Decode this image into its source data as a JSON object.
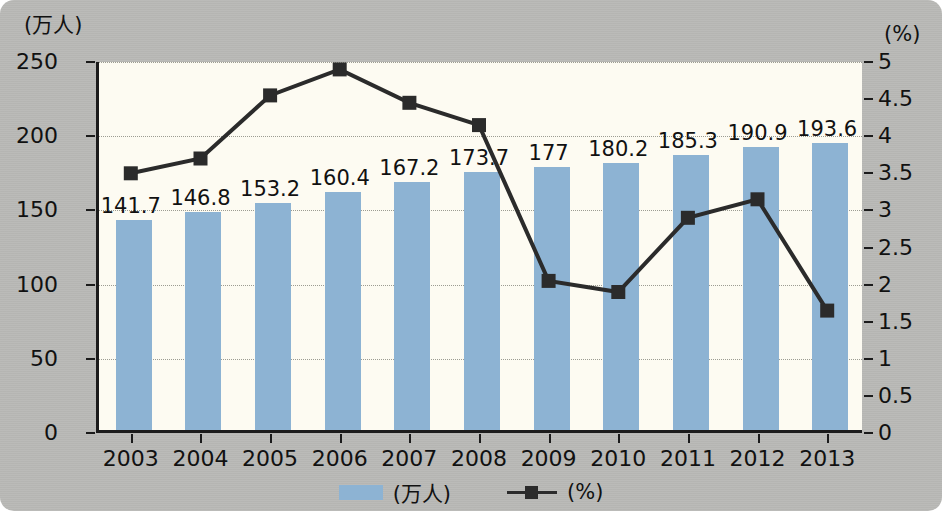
{
  "chart_data": {
    "type": "bar",
    "title": "",
    "subtitle": "",
    "categories": [
      "2003",
      "2004",
      "2005",
      "2006",
      "2007",
      "2008",
      "2009",
      "2010",
      "2011",
      "2012",
      "2013"
    ],
    "xlabel": "",
    "grid": true,
    "legend_position": "bottom",
    "axes": {
      "left": {
        "label": "(万人)",
        "ticks": [
          "0",
          "50",
          "100",
          "150",
          "200",
          "250"
        ],
        "tick_values": [
          0,
          50,
          100,
          150,
          200,
          250
        ],
        "ylim": [
          0,
          250
        ]
      },
      "right": {
        "label": "(%)",
        "ticks": [
          "0",
          "0.5",
          "1",
          "1.5",
          "2",
          "2.5",
          "3",
          "3.5",
          "4",
          "4.5",
          "5"
        ],
        "tick_values": [
          0,
          0.5,
          1,
          1.5,
          2,
          2.5,
          3,
          3.5,
          4,
          4.5,
          5
        ],
        "ylim": [
          0,
          5
        ]
      }
    },
    "series": [
      {
        "name": "(万人)",
        "type": "bar",
        "axis": "left",
        "color": "#8db3d3",
        "values": [
          141.7,
          146.8,
          153.2,
          160.4,
          167.2,
          173.7,
          177,
          180.2,
          185.3,
          190.9,
          193.6
        ],
        "data_labels": [
          "141.7",
          "146.8",
          "153.2",
          "160.4",
          "167.2",
          "173.7",
          "177",
          "180.2",
          "185.3",
          "190.9",
          "193.6"
        ]
      },
      {
        "name": "(%)",
        "type": "line",
        "axis": "right",
        "color": "#2b2b2b",
        "marker": "square",
        "values": [
          3.5,
          3.7,
          4.55,
          4.9,
          4.45,
          4.15,
          2.05,
          1.9,
          2.9,
          3.15,
          1.65
        ],
        "data_labels": []
      }
    ]
  },
  "legend": {
    "items": [
      {
        "label": "(万人)",
        "marker": "swatch",
        "color": "#8db3d3"
      },
      {
        "label": "(%)",
        "marker": "line-square",
        "color": "#2b2b2b"
      }
    ]
  },
  "colors": {
    "background": "#b9b9b6",
    "plot_background": "#fdfbf2",
    "bar": "#8db3d3",
    "line": "#2b2b2b",
    "axis": "#1b1b1b",
    "grid": "#9c9c92",
    "text": "#111111"
  }
}
